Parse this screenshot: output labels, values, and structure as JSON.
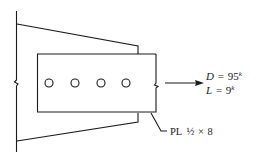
{
  "diagram": {
    "type": "structural-connection",
    "load": {
      "dead": {
        "symbol": "D",
        "eq": "=",
        "value": "95",
        "unit": "k"
      },
      "live": {
        "symbol": "L",
        "eq": "=",
        "value": "9",
        "unit": "k"
      }
    },
    "plate_label": {
      "prefix": "PL",
      "thickness": "½",
      "times": "×",
      "width": "8"
    },
    "bolt_count": 4,
    "colors": {
      "line": "#1a1a1a",
      "background": "#ffffff"
    }
  }
}
